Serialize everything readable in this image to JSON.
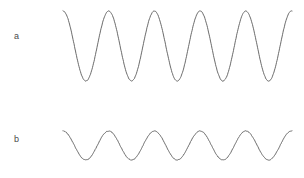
{
  "figure": {
    "width": 304,
    "height": 178,
    "background_color": "#ffffff",
    "trace_color": "#5a5a5a",
    "label_color": "#4a4a4a"
  },
  "labels": {
    "trace_a": "a",
    "trace_b": "b"
  },
  "chart_data": {
    "type": "line",
    "title": "",
    "xlabel": "",
    "ylabel": "",
    "grid": false,
    "legend": "none",
    "axes_visible": false,
    "x_range_px": [
      63,
      292
    ],
    "cycles_visible": 5,
    "period_px": 45.7,
    "series": [
      {
        "name": "a",
        "label": "a",
        "color": "#5a5a5a",
        "amplitude_px": 35,
        "center_y_px": 46,
        "peak_y_px": 11,
        "trough_y_px": 81,
        "phase": "starts at peak",
        "peaks_x_px": [
          63,
          109,
          155,
          200,
          246,
          292
        ],
        "troughs_x_px": [
          86,
          132,
          177,
          223,
          269
        ],
        "normalized_amplitude": 1.0
      },
      {
        "name": "b",
        "label": "b",
        "color": "#5a5a5a",
        "amplitude_px": 14.5,
        "center_y_px": 145.5,
        "peak_y_px": 131,
        "trough_y_px": 160,
        "phase": "starts at peak",
        "peaks_x_px": [
          63,
          109,
          155,
          200,
          246,
          292
        ],
        "troughs_x_px": [
          86,
          132,
          177,
          223,
          269
        ],
        "normalized_amplitude": 0.41
      }
    ]
  }
}
